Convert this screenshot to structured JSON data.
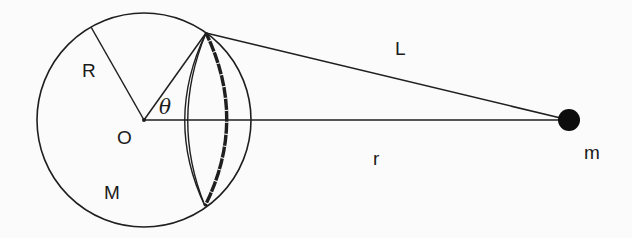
{
  "diagram": {
    "labels": {
      "radius": "R",
      "center": "O",
      "angle": "θ",
      "sphere_mass": "M",
      "slant_distance": "L",
      "center_distance": "r",
      "point_mass": "m"
    },
    "geometry": {
      "sphere_center": [
        144,
        120
      ],
      "sphere_radius": 107,
      "point_mass_center": [
        569,
        120
      ],
      "point_mass_radius": 11,
      "ring_top": [
        206,
        33
      ],
      "ring_bottom": [
        205,
        206
      ],
      "radius_line_end": [
        91,
        27
      ]
    },
    "colors": {
      "line": "#1f1f1f",
      "background": "#fbfbfb",
      "point_mass": "#0d0d0d"
    }
  }
}
